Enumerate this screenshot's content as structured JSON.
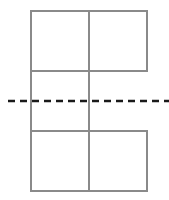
{
  "diagram": {
    "colors": {
      "outline": "#8a8a8a",
      "dashed_line": "#1a1a1a",
      "background": "#ffffff"
    },
    "grid": {
      "left": 31,
      "middle": 89,
      "right": 147,
      "top_row_top": 11,
      "top_row_bottom": 71,
      "bottom_row_top": 131,
      "bottom_row_bottom": 191
    },
    "dashed_line": {
      "y": 101,
      "x_start": 8,
      "x_end": 169
    }
  }
}
